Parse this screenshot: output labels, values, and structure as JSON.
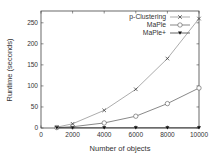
{
  "chart_data": {
    "type": "line",
    "title": "",
    "xlabel": "Number of objects",
    "ylabel": "Runtime (seconds)",
    "xlim": [
      0,
      10000
    ],
    "ylim": [
      0,
      278
    ],
    "xticks": [
      0,
      2000,
      4000,
      6000,
      8000,
      10000
    ],
    "yticks": [
      0,
      50,
      100,
      150,
      200,
      250
    ],
    "grid": false,
    "legend_position": "top-right",
    "x": [
      1000,
      2000,
      4000,
      6000,
      8000,
      10000
    ],
    "series": [
      {
        "name": "p-Clustering",
        "marker": "x",
        "values": [
          2,
          10,
          42,
          92,
          165,
          260
        ]
      },
      {
        "name": "MaPle",
        "marker": "circle",
        "values": [
          1,
          3,
          12,
          28,
          58,
          95
        ]
      },
      {
        "name": "MaPle+",
        "marker": "triangle-down-filled",
        "values": [
          0.5,
          0.5,
          0.5,
          0.5,
          0.5,
          0.5
        ]
      }
    ]
  }
}
